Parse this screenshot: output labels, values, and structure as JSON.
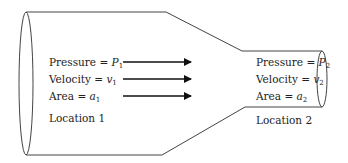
{
  "diagram": {
    "type": "pipe-flow-venturi",
    "colors": {
      "stroke": "#444444",
      "arrow": "#111111",
      "text": "#222222",
      "background": "#ffffff"
    },
    "location1": {
      "pressure_label": "Pressure = ",
      "pressure_var": "P",
      "pressure_sub": "1",
      "velocity_label": "Velocity = ",
      "velocity_var": "v",
      "velocity_sub": "1",
      "area_label": "Area = ",
      "area_var": "a",
      "area_sub": "1",
      "name": "Location 1"
    },
    "location2": {
      "pressure_label": "Pressure = ",
      "pressure_var": "P",
      "pressure_sub": "2",
      "velocity_label": "Velocity = ",
      "velocity_var": "v",
      "velocity_sub": "2",
      "area_label": "Area = ",
      "area_var": "a",
      "area_sub": "2",
      "name": "Location 2"
    },
    "flow_arrows": 3,
    "flow_direction": "left-to-right"
  }
}
